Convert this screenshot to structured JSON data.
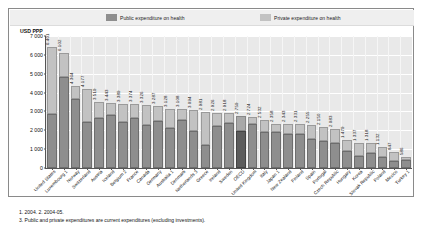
{
  "legend": {
    "public": {
      "label": "Public expenditure on health",
      "color": "#8e8e8e"
    },
    "private": {
      "label": "Private expenditure on health",
      "color": "#c2c2c2"
    }
  },
  "footnotes": [
    "1. 2004.   2. 2004-05.",
    "3. Public and private expenditures are current expenditures (excluding investments)."
  ],
  "chart_data": {
    "type": "bar",
    "title": "",
    "subtitle": "",
    "xlabel": "",
    "ylabel": "USD PPP",
    "ylim": [
      0,
      7000
    ],
    "yticks": [
      "0",
      "1 000",
      "2 000",
      "3 000",
      "4 000",
      "5 000",
      "6 000",
      "7 000"
    ],
    "ytick_values": [
      0,
      1000,
      2000,
      3000,
      4000,
      5000,
      6000,
      7000
    ],
    "grid": true,
    "stacked": true,
    "legend_position": "top",
    "highlight_category": "OECD",
    "categories": [
      "United States",
      "Luxembourg 1",
      "Norway",
      "Switzerland",
      "Austria",
      "Iceland",
      "Belgium 2",
      "France",
      "Canada",
      "Germany",
      "Australia 1",
      "Denmark",
      "Netherlands 3",
      "Greece",
      "Ireland",
      "Sweden",
      "OECD",
      "United Kingdom",
      "Italy",
      "Japan 1",
      "New Zealand",
      "Finland",
      "Spain",
      "Portugal",
      "Czech Republic",
      "Hungary",
      "Korea",
      "Slovak Republic",
      "Poland",
      "Mexico",
      "Turkey 1"
    ],
    "totals": [
      6401,
      6102,
      4364,
      4177,
      3519,
      3443,
      3389,
      3374,
      3326,
      3287,
      3128,
      3108,
      3094,
      2981,
      2926,
      2918,
      2759,
      2724,
      2532,
      2358,
      2343,
      2331,
      2255,
      2150,
      2083,
      1479,
      1337,
      1318,
      1132,
      847,
      586
    ],
    "series": [
      {
        "name": "Public expenditure on health",
        "values": [
          2884,
          4847,
          3649,
          2452,
          2626,
          2806,
          2455,
          2678,
          2298,
          2519,
          2103,
          2556,
          1948,
          1221,
          2230,
          2395,
          1965,
          2314,
          1890,
          1890,
          1798,
          1812,
          1557,
          1437,
          1306,
          904,
          639,
          786,
          576,
          377,
          412
        ]
      },
      {
        "name": "Private expenditure on health",
        "values": [
          3517,
          1255,
          715,
          1725,
          893,
          637,
          934,
          696,
          1028,
          768,
          1025,
          552,
          1146,
          1760,
          696,
          523,
          794,
          410,
          642,
          468,
          545,
          519,
          698,
          713,
          777,
          575,
          698,
          532,
          556,
          470,
          174
        ]
      }
    ],
    "value_labels": [
      "6 401",
      "6 102",
      "4 364",
      "4 177",
      "3 519",
      "3 443",
      "3 389",
      "3 374",
      "3 326",
      "3 287",
      "3 128",
      "3 108",
      "3 094",
      "2 981",
      "2 926",
      "2 918",
      "2 759",
      "2 724",
      "2 532",
      "2 358",
      "2 343",
      "2 331",
      "2 255",
      "2 150",
      "2 083",
      "1 479",
      "1 337",
      "1 318",
      "1 132",
      "847",
      "586"
    ]
  }
}
